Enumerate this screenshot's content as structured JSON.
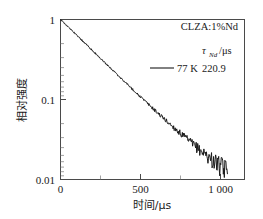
{
  "figure": {
    "background": "#ffffff",
    "frame_color": "#4a4a4a",
    "curve_color": "#1a1a1a"
  },
  "annotations": {
    "sample": "CLZA:1%Nd",
    "tau_symbol": "τ",
    "tau_subscript": "Nd",
    "tau_unit": "/μs",
    "legend_label": "77 K",
    "legend_value": "220.9"
  },
  "axes": {
    "x_label": "时间/μs",
    "y_label": "相对强度",
    "x_ticks": [
      "0",
      "500",
      "1 000"
    ],
    "y_ticks": [
      "1",
      "0.1",
      "0.01"
    ]
  },
  "chart_data": {
    "type": "line",
    "title": "",
    "subtitle": "",
    "xlabel": "时间/μs",
    "ylabel": "相对强度",
    "xlim": [
      0,
      1150
    ],
    "ylim": [
      0.01,
      1
    ],
    "yscale": "log",
    "xscale": "linear",
    "grid": false,
    "legend_position": "upper-right",
    "x_tick_values": [
      0,
      500,
      1000
    ],
    "x_tick_labels": [
      "0",
      "500",
      "1 000"
    ],
    "x_minor_tick_values": [
      250,
      750
    ],
    "y_tick_values": [
      1,
      0.1,
      0.01
    ],
    "y_tick_labels": [
      "1",
      "0.1",
      "0.01"
    ],
    "annotations": [
      {
        "text": "CLZA:1%Nd",
        "position": "upper-right"
      },
      {
        "text": "τ_Nd/μs",
        "position": "upper-right"
      }
    ],
    "series": [
      {
        "name": "77 K",
        "lifetime_us": 220.9,
        "lifetime_label": "220.9",
        "color": "#1a1a1a",
        "model": "I(t) = exp(-t/220.9)",
        "x": [
          0,
          20,
          40,
          60,
          80,
          100,
          120,
          140,
          160,
          180,
          200,
          220,
          240,
          260,
          280,
          300,
          320,
          340,
          360,
          380,
          400,
          420,
          440,
          460,
          480,
          500,
          520,
          540,
          560,
          580,
          600,
          620,
          640,
          660,
          680,
          700,
          720,
          740,
          760,
          780,
          800,
          820,
          840,
          860,
          880,
          900,
          920,
          940,
          960,
          980,
          1000,
          1020,
          1040,
          1060
        ],
        "y": [
          1.0,
          0.914,
          0.835,
          0.763,
          0.697,
          0.637,
          0.582,
          0.532,
          0.486,
          0.444,
          0.406,
          0.371,
          0.339,
          0.309,
          0.283,
          0.258,
          0.236,
          0.216,
          0.197,
          0.18,
          0.164,
          0.15,
          0.137,
          0.125,
          0.115,
          0.105,
          0.0955,
          0.0873,
          0.0798,
          0.0729,
          0.0666,
          0.0609,
          0.0556,
          0.0508,
          0.0464,
          0.0424,
          0.0388,
          0.0354,
          0.0324,
          0.0296,
          0.027,
          0.0247,
          0.0226,
          0.0206,
          0.0188,
          0.0172,
          0.0157,
          0.0144,
          0.0131,
          0.012,
          0.011,
          0.0103,
          0.0099,
          0.0098
        ]
      }
    ]
  }
}
